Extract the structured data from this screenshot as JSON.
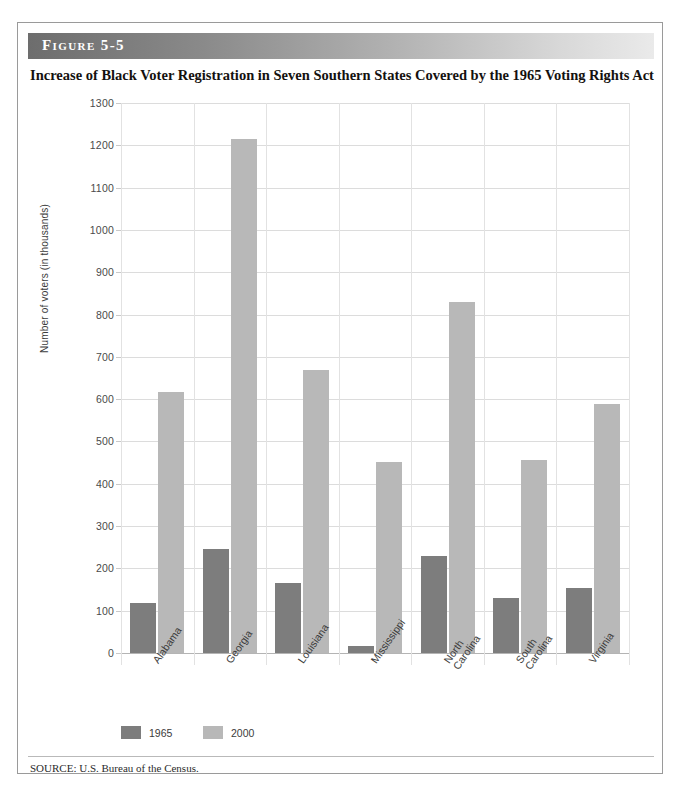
{
  "figure": {
    "number_label": "Figure 5-5",
    "title": "Increase of Black Voter Registration in Seven Southern States Covered by the 1965 Voting Rights Act",
    "source": "SOURCE: U.S. Bureau of the Census."
  },
  "colors": {
    "series_1965": "#7d7d7d",
    "series_2000": "#b8b8b8",
    "gridline": "#dcdcdc",
    "axis": "#b4b4b4",
    "border": "#9a9a9a",
    "header_dark": "#6d6d6d",
    "header_light": "#eaeaea"
  },
  "chart_data": {
    "type": "bar",
    "title": "Increase of Black Voter Registration in Seven Southern States Covered by the 1965 Voting Rights Act",
    "xlabel": "",
    "ylabel": "Number of voters (in thousands)",
    "categories": [
      "Alabama",
      "Georgia",
      "Louisiana",
      "Mississippi",
      "North Carolina",
      "South Carolina",
      "Virginia"
    ],
    "series": [
      {
        "name": "1965",
        "values": [
          118,
          245,
          165,
          17,
          230,
          129,
          154
        ]
      },
      {
        "name": "2000",
        "values": [
          617,
          1215,
          670,
          452,
          830,
          456,
          589
        ]
      }
    ],
    "ylim": [
      0,
      1300
    ],
    "ytick_values": [
      0,
      100,
      200,
      300,
      400,
      500,
      600,
      700,
      800,
      900,
      1000,
      1100,
      1200,
      1300
    ],
    "ytick_labels": [
      "0",
      "100",
      "200",
      "300",
      "400",
      "500",
      "600",
      "700",
      "800",
      "900",
      "1000",
      "1100",
      "1200",
      "1300"
    ],
    "grid": true,
    "legend": [
      "1965",
      "2000"
    ],
    "legend_position": "bottom-left"
  }
}
